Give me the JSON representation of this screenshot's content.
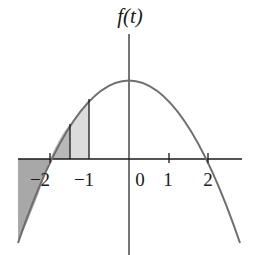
{
  "figure": {
    "y_axis_label": "f(t)",
    "function": "downward parabola with roots at t=-2 and t=2, maximum at t=0",
    "x_ticks": [
      {
        "value": -2,
        "label": "−2"
      },
      {
        "value": -1,
        "label": "−1"
      },
      {
        "value": 0,
        "label": "0"
      },
      {
        "value": 1,
        "label": "1"
      },
      {
        "value": 2,
        "label": "2"
      }
    ],
    "shaded_regions": [
      {
        "from": -3,
        "to": -2,
        "shade": "dark",
        "color": "#a8a8a8"
      },
      {
        "from": -2,
        "to": -1.5,
        "shade": "medium",
        "color": "#b8b8b8"
      },
      {
        "from": -1.5,
        "to": -1,
        "shade": "light",
        "color": "#dcdcdc"
      }
    ],
    "curve_color": "#6e6e6e",
    "axis_color": "#1a1a1a"
  }
}
